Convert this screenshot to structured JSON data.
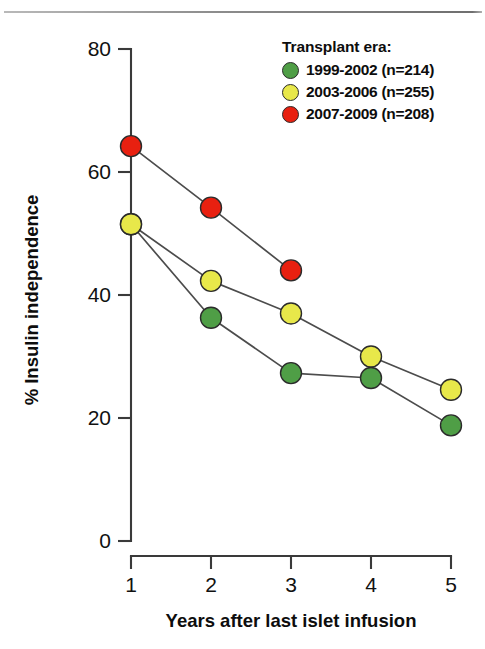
{
  "figure": {
    "background": "#ffffff",
    "has_top_rule": true
  },
  "legend": {
    "title": "Transplant era:",
    "position": "top-right",
    "items": [
      {
        "label": "1999-2002 (n=214)",
        "color": "#4f9e46",
        "icon": "circle-marker-icon"
      },
      {
        "label": "2003-2006 (n=255)",
        "color": "#e8e84a",
        "icon": "circle-marker-icon"
      },
      {
        "label": "2007-2009 (n=208)",
        "color": "#e82010",
        "icon": "circle-marker-icon"
      }
    ]
  },
  "chart_data": {
    "type": "line",
    "title": "",
    "xlabel": "Years after last islet infusion",
    "ylabel": "% Insulin independence",
    "x": [
      1,
      2,
      3,
      4,
      5
    ],
    "xticklabels": [
      "1",
      "2",
      "3",
      "4",
      "5"
    ],
    "xlim": [
      1,
      5
    ],
    "yticks": [
      0,
      20,
      40,
      60,
      80
    ],
    "yticklabels": [
      "0",
      "20",
      "40",
      "60",
      "80"
    ],
    "ylim": [
      0,
      80
    ],
    "grid": false,
    "legend_position": "top-right",
    "marker": "circle",
    "line_color": "#4c4c4c",
    "series": [
      {
        "name": "1999-2002 (n=214)",
        "color": "#4f9e46",
        "x": [
          1,
          2,
          3,
          4,
          5
        ],
        "values": [
          51.5,
          36.3,
          27.3,
          26.5,
          18.8
        ]
      },
      {
        "name": "2003-2006 (n=255)",
        "color": "#e8e84a",
        "x": [
          1,
          2,
          3,
          4,
          5
        ],
        "values": [
          51.5,
          42.3,
          37.0,
          30.0,
          24.6
        ]
      },
      {
        "name": "2007-2009 (n=208)",
        "color": "#e82010",
        "x": [
          1,
          2,
          3
        ],
        "values": [
          64.2,
          54.2,
          44.0
        ]
      }
    ]
  },
  "axes": {
    "y_title": "% Insulin independence",
    "x_title": "Years after last islet infusion",
    "y_ticks": [
      {
        "value": 80,
        "label": "80"
      },
      {
        "value": 60,
        "label": "60"
      },
      {
        "value": 40,
        "label": "40"
      },
      {
        "value": 20,
        "label": "20"
      },
      {
        "value": 0,
        "label": "0"
      }
    ],
    "x_ticks": [
      {
        "value": 1,
        "label": "1"
      },
      {
        "value": 2,
        "label": "2"
      },
      {
        "value": 3,
        "label": "3"
      },
      {
        "value": 4,
        "label": "4"
      },
      {
        "value": 5,
        "label": "5"
      }
    ]
  }
}
